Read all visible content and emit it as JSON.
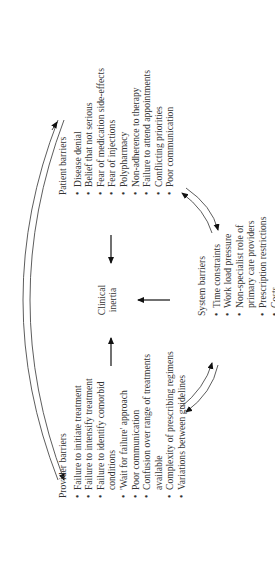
{
  "diagram": {
    "center": {
      "line1": "Clinical",
      "line2": "inertia"
    },
    "provider": {
      "title": "Provider barriers",
      "items": [
        "Failure to initiate treatment",
        "Failure to intensify treatment",
        "Failure to identify comorbid",
        "conditions",
        "'Wait for failure' approach",
        "Poor communication",
        "Confusion over range of treatments",
        "available",
        "Complexity of prescribing regimens",
        "Variations between guidelines"
      ]
    },
    "patient": {
      "title": "Patient barriers",
      "items": [
        "Disease denial",
        "Belief that not serious",
        "Fear of medication side-effects",
        "Fear of injections",
        "Polypharmacy",
        "Non-adherence to therapy",
        "Failure to attend appointments",
        "Conflicting priorities",
        "Poor communication"
      ]
    },
    "system": {
      "title": "System barriers",
      "items": [
        "Time constraints",
        "Work load pressure",
        "Non-specialist role of",
        "primary care providers",
        "Prescription restrictions",
        "Costs"
      ]
    },
    "rotation_deg": -90,
    "colors": {
      "text": "#333333",
      "line": "#111111"
    }
  }
}
